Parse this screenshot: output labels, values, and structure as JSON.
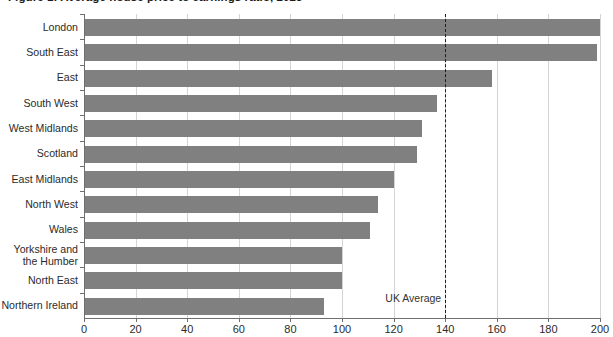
{
  "chart_data": {
    "type": "bar",
    "orientation": "horizontal",
    "title": "Figure 1: Average house price to earnings ratio, 2023",
    "xlabel": "",
    "ylabel": "",
    "xlim": [
      0,
      200
    ],
    "xticks": [
      0,
      20,
      40,
      60,
      80,
      100,
      120,
      140,
      160,
      180,
      200
    ],
    "grid": true,
    "grid_axis": "x",
    "legend": "none",
    "bar_color": "#808080",
    "categories": [
      "London",
      "South East",
      "East",
      "South West",
      "West Midlands",
      "Scotland",
      "East Midlands",
      "North West",
      "Wales",
      "Yorkshire and\nthe Humber",
      "North East",
      "Northern Ireland"
    ],
    "values": [
      200,
      199,
      158,
      137,
      131,
      129,
      120,
      114,
      111,
      100,
      100,
      93
    ],
    "annotations": [
      {
        "name": "uk-average",
        "label": "UK Average",
        "value": 140,
        "style": "dashed-vertical-line",
        "color": "#1c1c1c"
      }
    ]
  }
}
